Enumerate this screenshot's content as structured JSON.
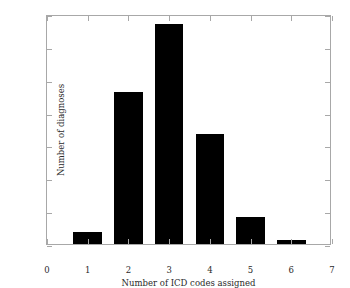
{
  "chart_data": {
    "type": "bar",
    "title": "",
    "subtitle": "",
    "xlabel": "Number of ICD codes assigned",
    "ylabel": "Number of diagnoses",
    "categories": [
      1,
      2,
      3,
      4,
      5,
      6
    ],
    "values": [
      18,
      231,
      335,
      167,
      41,
      6
    ],
    "series": [
      {
        "name": "Number of diagnoses",
        "values": [
          18,
          231,
          335,
          167,
          41,
          6
        ]
      }
    ],
    "xlim": [
      0,
      7
    ],
    "ylim": [
      0,
      350
    ],
    "xticks": [
      0,
      1,
      2,
      3,
      4,
      5,
      6,
      7
    ],
    "yticks": [
      0,
      50,
      100,
      150,
      200,
      250,
      300,
      350
    ],
    "xtick_labels": [
      "0",
      "1",
      "2",
      "3",
      "4",
      "5",
      "6",
      "7"
    ],
    "ytick_labels": [
      "0",
      "50",
      "100",
      "150",
      "200",
      "250",
      "300",
      "350"
    ],
    "bar_width": 0.7,
    "bar_color": "#000000",
    "axis_color": "#a8a8a8",
    "text_color": "#2a2a2a",
    "background_color": "#ffffff",
    "grid": false,
    "legend": null,
    "legend_position": "none",
    "annotations": []
  }
}
